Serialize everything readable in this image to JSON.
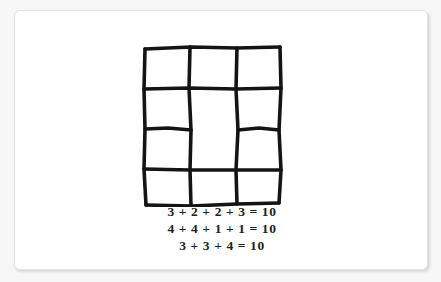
{
  "canvas": {
    "background_color": "#f7f7f7",
    "card_background_color": "#ffffff",
    "card_border_color": "#e3e3e3"
  },
  "figure": {
    "ink_color": "#141414",
    "grid": {
      "type": "hand-drawn-rectangle-partition",
      "columns": 3,
      "rows": 4,
      "total_cells": 11,
      "description": "Hand drawn rectangle divided into 11 boxes; middle column rows 2 and 3 merged into one tall box",
      "column_counts": [
        4,
        3,
        4
      ],
      "cells": [
        {
          "id": "r1c1",
          "row": 1,
          "col": 1,
          "row_span": 1
        },
        {
          "id": "r1c2",
          "row": 1,
          "col": 2,
          "row_span": 1
        },
        {
          "id": "r1c3",
          "row": 1,
          "col": 3,
          "row_span": 1
        },
        {
          "id": "r2c1",
          "row": 2,
          "col": 1,
          "row_span": 1
        },
        {
          "id": "r2c2",
          "row": 2,
          "col": 2,
          "row_span": 2
        },
        {
          "id": "r2c3",
          "row": 2,
          "col": 3,
          "row_span": 1
        },
        {
          "id": "r3c1",
          "row": 3,
          "col": 1,
          "row_span": 1
        },
        {
          "id": "r3c3",
          "row": 3,
          "col": 3,
          "row_span": 1
        },
        {
          "id": "r4c1",
          "row": 4,
          "col": 1,
          "row_span": 1
        },
        {
          "id": "r4c2",
          "row": 4,
          "col": 2,
          "row_span": 1
        },
        {
          "id": "r4c3",
          "row": 4,
          "col": 3,
          "row_span": 1
        }
      ]
    },
    "equations": [
      {
        "id": "equation-1",
        "text": "3 + 2 + 2 + 3 = 10",
        "addends": [
          3,
          2,
          2,
          3
        ],
        "sum": 10
      },
      {
        "id": "equation-2",
        "text": "4 + 4 + 1 + 1 = 10",
        "addends": [
          4,
          4,
          1,
          1
        ],
        "sum": 10
      },
      {
        "id": "equation-3",
        "text": "3 + 3 + 4 = 10",
        "addends": [
          3,
          3,
          4
        ],
        "sum": 10
      }
    ]
  }
}
